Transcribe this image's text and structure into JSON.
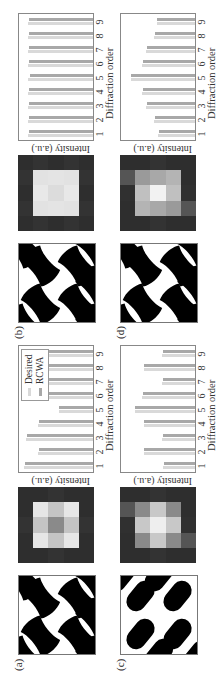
{
  "panels": [
    {
      "id": "a",
      "label": "(a)",
      "pattern_shape": "bowtie",
      "heatmap": [
        [
          "#2e2e2e",
          "#2e2e2e",
          "#333333",
          "#2e2e2e",
          "#2e2e2e"
        ],
        [
          "#2e2e2e",
          "#e6e6e6",
          "#c4c4c4",
          "#e6e6e6",
          "#2e2e2e"
        ],
        [
          "#333333",
          "#c4c4c4",
          "#8a8a8a",
          "#c4c4c4",
          "#333333"
        ],
        [
          "#2e2e2e",
          "#e6e6e6",
          "#c4c4c4",
          "#e6e6e6",
          "#2e2e2e"
        ],
        [
          "#2e2e2e",
          "#2e2e2e",
          "#333333",
          "#2e2e2e",
          "#2e2e2e"
        ]
      ],
      "show_legend": true
    },
    {
      "id": "b",
      "label": "(b)",
      "pattern_shape": "bowtie",
      "heatmap": [
        [
          "#2e2e2e",
          "#333333",
          "#2e2e2e",
          "#333333",
          "#2e2e2e"
        ],
        [
          "#333333",
          "#e2e2e2",
          "#e8e8e8",
          "#e2e2e2",
          "#333333"
        ],
        [
          "#2e2e2e",
          "#e4e4e4",
          "#dcdcdc",
          "#e4e4e4",
          "#2e2e2e"
        ],
        [
          "#333333",
          "#e2e2e2",
          "#e8e8e8",
          "#e2e2e2",
          "#333333"
        ],
        [
          "#2e2e2e",
          "#333333",
          "#2e2e2e",
          "#333333",
          "#2e2e2e"
        ]
      ],
      "show_legend": false
    },
    {
      "id": "c",
      "label": "(c)",
      "pattern_shape": "capsule",
      "heatmap": [
        [
          "#2e2e2e",
          "#2e2e2e",
          "#303030",
          "#555555",
          "#2e2e2e"
        ],
        [
          "#2e2e2e",
          "#8a8a8a",
          "#c8c8c8",
          "#8a8a8a",
          "#2e2e2e"
        ],
        [
          "#333333",
          "#c8c8c8",
          "#eeeeee",
          "#c8c8c8",
          "#333333"
        ],
        [
          "#2e2e2e",
          "#8a8a8a",
          "#c8c8c8",
          "#8a8a8a",
          "#2e2e2e"
        ],
        [
          "#2e2e2e",
          "#555555",
          "#303030",
          "#2e2e2e",
          "#2e2e2e"
        ]
      ],
      "show_legend": false
    },
    {
      "id": "d",
      "label": "(d)",
      "pattern_shape": "bowtie",
      "heatmap": [
        [
          "#2e2e2e",
          "#2e2e2e",
          "#303030",
          "#555555",
          "#2e2e2e"
        ],
        [
          "#2e2e2e",
          "#b4b4b4",
          "#c0c0c0",
          "#9a9a9a",
          "#2e2e2e"
        ],
        [
          "#333333",
          "#a8a8a8",
          "#f2f2f2",
          "#a8a8a8",
          "#333333"
        ],
        [
          "#2e2e2e",
          "#9a9a9a",
          "#c0c0c0",
          "#b4b4b4",
          "#2e2e2e"
        ],
        [
          "#2e2e2e",
          "#555555",
          "#303030",
          "#2e2e2e",
          "#2e2e2e"
        ]
      ],
      "show_legend": false
    }
  ],
  "axes": {
    "xlabel": "Diffraction order",
    "ylabel": "Intensity (a.u.)",
    "ticks": [
      "1",
      "2",
      "3",
      "4",
      "5",
      "6",
      "7",
      "8",
      "9"
    ]
  },
  "legend": {
    "desired_label": "Desired",
    "rcwa_label": "RCWA",
    "desired_color": "#d9d9d9",
    "rcwa_color": "#a8a8a8"
  },
  "chart_data": [
    {
      "type": "bar",
      "panel": "(a)",
      "title": "",
      "xlabel": "Diffraction order",
      "ylabel": "Intensity (a.u.)",
      "categories": [
        "1",
        "2",
        "3",
        "4",
        "5",
        "6",
        "7",
        "8",
        "9"
      ],
      "series": [
        {
          "name": "Desired",
          "values": [
            1.0,
            0.8,
            0.98,
            0.8,
            0.5,
            0.8,
            0.98,
            0.8,
            1.0
          ]
        },
        {
          "name": "RCWA",
          "values": [
            0.99,
            0.79,
            0.97,
            0.79,
            0.5,
            0.79,
            0.97,
            0.79,
            0.99
          ]
        }
      ],
      "ylim": [
        0,
        1.05
      ],
      "legend_position": "upper right"
    },
    {
      "type": "bar",
      "panel": "(b)",
      "title": "",
      "xlabel": "Diffraction order",
      "ylabel": "Intensity (a.u.)",
      "categories": [
        "1",
        "2",
        "3",
        "4",
        "5",
        "6",
        "7",
        "8",
        "9"
      ],
      "series": [
        {
          "name": "Desired",
          "values": [
            0.95,
            0.95,
            0.95,
            0.95,
            0.95,
            0.95,
            0.95,
            0.95,
            0.95
          ]
        },
        {
          "name": "RCWA",
          "values": [
            0.94,
            0.93,
            0.94,
            0.93,
            0.92,
            0.93,
            0.94,
            0.93,
            0.94
          ]
        }
      ],
      "ylim": [
        0,
        1.05
      ]
    },
    {
      "type": "bar",
      "panel": "(c)",
      "title": "",
      "xlabel": "Diffraction order",
      "ylabel": "Intensity (a.u.)",
      "categories": [
        "1",
        "2",
        "3",
        "4",
        "5",
        "6",
        "7",
        "8",
        "9"
      ],
      "series": [
        {
          "name": "Desired",
          "values": [
            0.46,
            0.75,
            0.48,
            0.75,
            0.88,
            0.77,
            0.48,
            0.75,
            0.48
          ]
        },
        {
          "name": "RCWA",
          "values": [
            0.45,
            0.74,
            0.47,
            0.74,
            0.87,
            0.76,
            0.47,
            0.74,
            0.47
          ]
        }
      ],
      "ylim": [
        0,
        1.05
      ]
    },
    {
      "type": "bar",
      "panel": "(d)",
      "title": "",
      "xlabel": "Diffraction order",
      "ylabel": "Intensity (a.u.)",
      "categories": [
        "1",
        "2",
        "3",
        "4",
        "5",
        "6",
        "7",
        "8",
        "9"
      ],
      "series": [
        {
          "name": "Desired",
          "values": [
            0.54,
            0.6,
            0.71,
            0.77,
            0.94,
            0.77,
            0.71,
            0.6,
            0.56
          ]
        },
        {
          "name": "RCWA",
          "values": [
            0.53,
            0.59,
            0.7,
            0.76,
            0.93,
            0.76,
            0.7,
            0.59,
            0.55
          ]
        }
      ],
      "ylim": [
        0,
        1.05
      ]
    }
  ]
}
